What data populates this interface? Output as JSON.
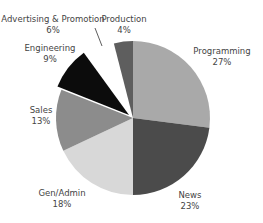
{
  "chart_data": {
    "type": "pie",
    "title": "",
    "categories": [
      "Programming",
      "News",
      "Gen/Admin",
      "Sales",
      "Engineering",
      "Advertising & Promotion",
      "Production"
    ],
    "values": [
      27,
      23,
      18,
      13,
      9,
      6,
      4
    ],
    "value_labels": [
      "27%",
      "23%",
      "18%",
      "13%",
      "9%",
      "6%",
      "4%"
    ],
    "colors": [
      "#a9a9a9",
      "#4b4b4b",
      "#d8d8d8",
      "#8c8c8c",
      "#0c0c0c",
      "#ffffff",
      "#5e5e5e"
    ],
    "start_angle": "12 o'clock",
    "direction": "clockwise",
    "legend": "none (direct labels)"
  },
  "labels": [
    {
      "name": "Programming",
      "pct": "27%",
      "x": 222,
      "y": 46
    },
    {
      "name": "News",
      "pct": "23%",
      "x": 190,
      "y": 190
    },
    {
      "name": "Gen/Admin",
      "pct": "18%",
      "x": 62,
      "y": 188
    },
    {
      "name": "Sales",
      "pct": "13%",
      "x": 41,
      "y": 105
    },
    {
      "name": "Engineering",
      "pct": "9%",
      "x": 50,
      "y": 43
    },
    {
      "name": "Advertising & Promotion",
      "pct": "6%",
      "x": 53,
      "y": 14
    },
    {
      "name": "Production",
      "pct": "4%",
      "x": 124,
      "y": 14
    }
  ]
}
